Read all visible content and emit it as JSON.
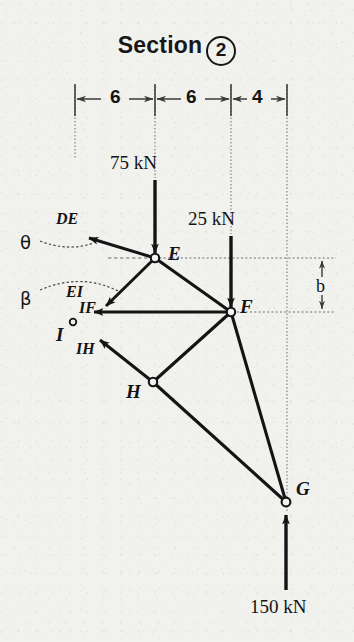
{
  "title": {
    "text": "Section",
    "circled_number": "2"
  },
  "dimensions": {
    "top_row": [
      {
        "label": "6",
        "x_from": 75,
        "x_to": 155
      },
      {
        "label": "6",
        "x_from": 155,
        "x_to": 231
      },
      {
        "label": "4",
        "x_from": 231,
        "x_to": 287
      }
    ],
    "vertical": {
      "label": "b",
      "x": 322,
      "y_from": 258,
      "y_to": 312
    }
  },
  "loads": [
    {
      "name": "load-75",
      "label": "75 kN",
      "direction": "down",
      "at_joint": "E",
      "x": 155,
      "y_from": 180,
      "y_to": 256
    },
    {
      "name": "load-25",
      "label": "25 kN",
      "direction": "down",
      "at_joint": "F",
      "x": 231,
      "y_from": 236,
      "y_to": 310
    },
    {
      "name": "load-150",
      "label": "150 kN",
      "direction": "up",
      "at_joint": "G",
      "x": 286,
      "y_from": 590,
      "y_to": 512
    }
  ],
  "joints": [
    {
      "id": "E",
      "label": "E",
      "x": 155,
      "y": 258
    },
    {
      "id": "F",
      "label": "F",
      "x": 231,
      "y": 312
    },
    {
      "id": "H",
      "label": "H",
      "x": 153,
      "y": 382
    },
    {
      "id": "G",
      "label": "G",
      "x": 286,
      "y": 502
    },
    {
      "id": "I",
      "label": "I",
      "x": 73,
      "y": 326
    }
  ],
  "member_forces": [
    {
      "label": "DE",
      "at_joint": "E",
      "direction": "up-left"
    },
    {
      "label": "EI",
      "at_joint": "E",
      "direction": "down-left"
    },
    {
      "label": "IF",
      "at_joint": "F",
      "direction": "left"
    },
    {
      "label": "IH",
      "at_joint": "H",
      "direction": "up-left"
    }
  ],
  "angles": [
    {
      "label": "θ",
      "refers_to": "DE",
      "x": 22,
      "y": 236
    },
    {
      "label": "β",
      "refers_to": "EI",
      "x": 22,
      "y": 292
    }
  ],
  "colors": {
    "ink": "#141417",
    "paper": "#f1f1ed",
    "construction_line": "#6d6d70"
  }
}
